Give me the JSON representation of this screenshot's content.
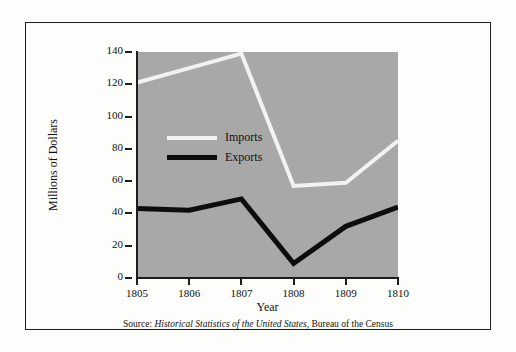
{
  "figure": {
    "background_color": "#fdfdfb",
    "frame_color": "#1d1d1d",
    "plot_background_color": "#a8a8a8"
  },
  "source_note": {
    "prefix": "Source: ",
    "italic_part": "Historical Statistics of the United States",
    "suffix": ", Bureau of the Census",
    "full": "Source: Historical Statistics of the United States, Bureau of the Census"
  },
  "chart_data": {
    "type": "line",
    "title": "",
    "xlabel": "Year",
    "ylabel": "Millions of Dollars",
    "categories": [
      "1805",
      "1806",
      "1807",
      "1808",
      "1809",
      "1810"
    ],
    "x": [
      1805,
      1806,
      1807,
      1808,
      1809,
      1810
    ],
    "xlim": [
      1805,
      1810
    ],
    "ylim": [
      0,
      140
    ],
    "yticks": [
      0,
      20,
      40,
      60,
      80,
      100,
      120,
      140
    ],
    "ytick_labels": [
      "0",
      "20",
      "40",
      "60",
      "80",
      "100",
      "120",
      "140"
    ],
    "grid": false,
    "legend_position": "inside-upper-left",
    "series": [
      {
        "name": "Imports",
        "color": "#f2f2f2",
        "line_width": 4,
        "values": [
          121,
          130,
          139,
          57,
          59,
          85
        ]
      },
      {
        "name": "Exports",
        "color": "#0d0d0d",
        "line_width": 5,
        "values": [
          43,
          42,
          49,
          9,
          32,
          44
        ]
      }
    ]
  }
}
